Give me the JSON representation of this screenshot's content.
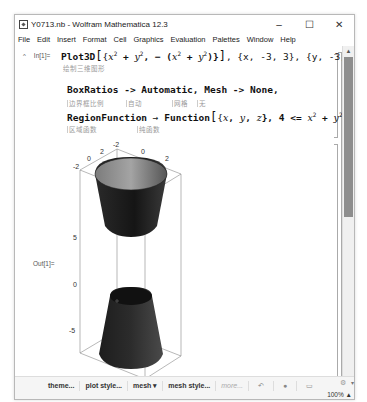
{
  "window": {
    "title": "Y0713.nb - Wolfram Mathematica 12.3",
    "controls": {
      "minimize": "–",
      "maximize": "☐",
      "close": "✕"
    }
  },
  "menu": [
    "File",
    "Edit",
    "Insert",
    "Format",
    "Cell",
    "Graphics",
    "Evaluation",
    "Palettes",
    "Window",
    "Help"
  ],
  "input_cell": {
    "label": "In[1]=",
    "collapse_glyph": "^",
    "line1": {
      "func": "Plot3D",
      "args": "{x² + y², −(x² + y²)}, {x, −3, 3}, {y, −3, 3},",
      "hint": "绘制三维图形"
    },
    "line2": {
      "text": "BoxRatios -> Automatic, Mesh -> None,",
      "hints": [
        "边界框比例",
        "自动",
        "网格",
        "无"
      ]
    },
    "line3": {
      "text": "RegionFunction → Function[{x, y, z}, 4 <= x² + y² <= 9]]",
      "hints": [
        "区域函数",
        "纯函数"
      ]
    }
  },
  "output_cell": {
    "label": "Out[1]=",
    "plot": {
      "x_ticks": [
        "-2",
        "0",
        "2"
      ],
      "y_ticks": [
        "-2",
        "0",
        "2"
      ],
      "z_ticks": [
        "5",
        "0",
        "-5"
      ]
    }
  },
  "suggestions_bar": {
    "items": [
      "theme...",
      "plot style...",
      "mesh ▾",
      "mesh style...",
      "more..."
    ],
    "icons": [
      "undo-icon",
      "gear-icon",
      "chat-icon"
    ]
  },
  "status": {
    "zoom": "100%"
  },
  "colors": {
    "surface_dark": "#1f1f1f",
    "surface_light": "#9a9a9a",
    "box_line": "#888888",
    "scroll_thumb": "#8e8e8e"
  }
}
